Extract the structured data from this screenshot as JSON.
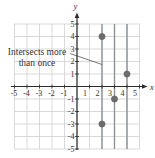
{
  "figure": {
    "background": "#ffffff",
    "annotation": {
      "line1": "Intersects more",
      "line2": "than once"
    },
    "colors": {
      "grid": "#cccccc",
      "axis": "#2b2b2b",
      "vline": "#8e9296",
      "point": "#6c6c6c",
      "point_edge": "#5d5d5d",
      "label": "#333333",
      "leader": "#555555"
    }
  },
  "chart_data": {
    "type": "scatter",
    "title": "",
    "xlabel": "x",
    "ylabel": "y",
    "xlim": [
      -5,
      5
    ],
    "ylim": [
      -5,
      5
    ],
    "grid": true,
    "x_ticks": [
      -5,
      -4,
      -3,
      -2,
      -1,
      1,
      2,
      3,
      4,
      5
    ],
    "y_ticks": [
      -5,
      -4,
      -3,
      -2,
      -1,
      1,
      2,
      3,
      4,
      5
    ],
    "points": [
      [
        2,
        4
      ],
      [
        4,
        1
      ],
      [
        3,
        -1
      ],
      [
        2,
        -3
      ]
    ],
    "vertical_lines": [
      2,
      3,
      4
    ],
    "annotation": {
      "text": "Intersects more than once",
      "leader_from": [
        -0.56,
        2.64
      ],
      "leader_to": [
        2,
        1.76
      ]
    }
  }
}
